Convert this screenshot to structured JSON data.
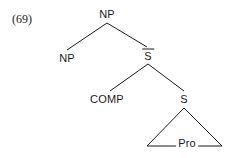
{
  "figure": {
    "example_number": "(69)",
    "type": "syntactic-tree-diagram",
    "ink_color": "#1a1a1a",
    "background_color": "#ffffff"
  },
  "nodes": {
    "root_np": {
      "label": "NP",
      "x": 107,
      "y": 14,
      "overline": false
    },
    "left_np": {
      "label": "NP",
      "x": 67,
      "y": 58,
      "overline": false
    },
    "s_bar_upper": {
      "label": "S",
      "x": 148,
      "y": 55,
      "overline": true
    },
    "comp": {
      "label": "COMP",
      "x": 107,
      "y": 99,
      "overline": false
    },
    "s_lower": {
      "label": "S",
      "x": 184,
      "y": 99,
      "overline": false
    },
    "pro": {
      "label": "Pro",
      "x": 187,
      "y": 142,
      "overline": false
    }
  },
  "edges": [
    {
      "name": "root-np-to-left-np",
      "x1": 107,
      "y1": 23,
      "x2": 67,
      "y2": 50
    },
    {
      "name": "root-np-to-s-bar",
      "x1": 107,
      "y1": 23,
      "x2": 147,
      "y2": 47
    },
    {
      "name": "s-bar-to-comp",
      "x1": 148,
      "y1": 64,
      "x2": 110,
      "y2": 91
    },
    {
      "name": "s-bar-to-s-lower",
      "x1": 148,
      "y1": 64,
      "x2": 184,
      "y2": 91
    }
  ],
  "triangle": {
    "name": "pro-triangle",
    "apex_x": 184,
    "apex_y": 108,
    "base_left_x": 147,
    "base_right_x": 222,
    "base_y": 146
  }
}
